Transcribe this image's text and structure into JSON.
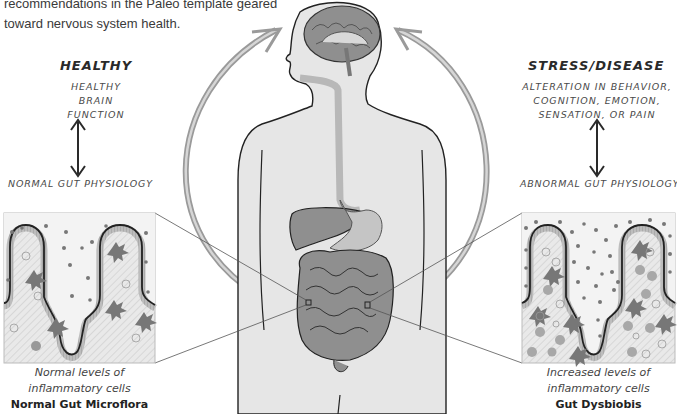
{
  "intro_text": {
    "line1": "recommendations in the Paleo template geared",
    "line2": "toward nervous system health."
  },
  "left_panel": {
    "title": "HEALTHY",
    "brain_state": [
      "HEALTHY",
      "BRAIN",
      "FUNCTION"
    ],
    "gut_state": "NORMAL GUT PHYSIOLOGY",
    "caption_line1": "Normal levels of",
    "caption_line2": "inflammatory cells",
    "caption_title": "Normal Gut Microflora"
  },
  "right_panel": {
    "title": "STRESS/DISEASE",
    "brain_state": [
      "ALTERATION IN BEHAVIOR,",
      "COGNITION, EMOTION,",
      "SENSATION, OR PAIN"
    ],
    "gut_state": "ABNORMAL GUT PHYSIOLOGY",
    "caption_line1": "Increased levels of",
    "caption_line2": "inflammatory cells",
    "caption_title": "Gut Dysbiobis"
  },
  "figure": {
    "center": "human-body-gut-brain-axis",
    "icons": [
      "brain-icon",
      "liver-icon",
      "stomach-icon",
      "intestines-icon",
      "bidirectional-arrow-icon",
      "curved-arrow-icon",
      "villi-icon"
    ]
  },
  "colors": {
    "body_fill": "#e6e6e6",
    "organ_fill": "#8f8f8f",
    "arrow_fill": "#b5b5b5",
    "outline": "#222222",
    "box_bg": "#f1f1f1"
  }
}
